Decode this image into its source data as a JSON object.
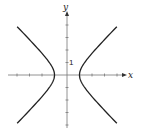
{
  "chart_data": {
    "type": "line",
    "title": "",
    "xlabel": "x",
    "ylabel": "y",
    "equation": "x^2 - y^2 = 1",
    "tick_labels": [
      {
        "axis": "y",
        "value": 1,
        "text": "1"
      }
    ],
    "xlim": [
      -4.5,
      4
    ],
    "ylim": [
      -4,
      5
    ],
    "grid": false,
    "legend": null,
    "series": [
      {
        "name": "right branch",
        "x": [
          4,
          3,
          2,
          1.5,
          1.2,
          1,
          1.2,
          1.5,
          2,
          3,
          4
        ],
        "y": [
          -3.87,
          -2.83,
          -1.73,
          -1.12,
          -0.66,
          0,
          0.66,
          1.12,
          1.73,
          2.83,
          3.87
        ]
      },
      {
        "name": "left branch",
        "x": [
          -4,
          -3,
          -2,
          -1.5,
          -1.2,
          -1,
          -1.2,
          -1.5,
          -2,
          -3,
          -4
        ],
        "y": [
          -3.87,
          -2.83,
          -1.73,
          -1.12,
          -0.66,
          0,
          0.66,
          1.12,
          1.73,
          2.83,
          3.87
        ]
      }
    ]
  },
  "axes": {
    "x_label": "x",
    "y_label": "y",
    "y_tick_label": "1"
  },
  "colors": {
    "curve": "#222222",
    "axis": "#666666"
  }
}
